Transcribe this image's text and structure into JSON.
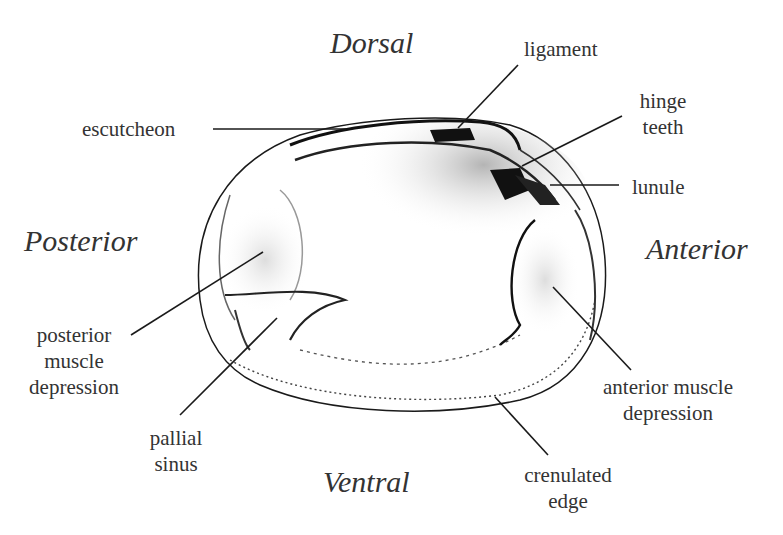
{
  "diagram": {
    "orientation": {
      "dorsal": "Dorsal",
      "ventral": "Ventral",
      "posterior": "Posterior",
      "anterior": "Anterior"
    },
    "labels": {
      "escutcheon": "escutcheon",
      "ligament": "ligament",
      "hinge_teeth_1": "hinge",
      "hinge_teeth_2": "teeth",
      "lunule": "lunule",
      "posterior_muscle_1": "posterior",
      "posterior_muscle_2": "muscle",
      "posterior_muscle_3": "depression",
      "pallial_sinus_1": "pallial",
      "pallial_sinus_2": "sinus",
      "anterior_muscle_1": "anterior muscle",
      "anterior_muscle_2": "depression",
      "crenulated_edge_1": "crenulated",
      "crenulated_edge_2": "edge"
    },
    "colors": {
      "ink": "#1a1a1a",
      "text": "#333333",
      "background": "#ffffff"
    }
  }
}
